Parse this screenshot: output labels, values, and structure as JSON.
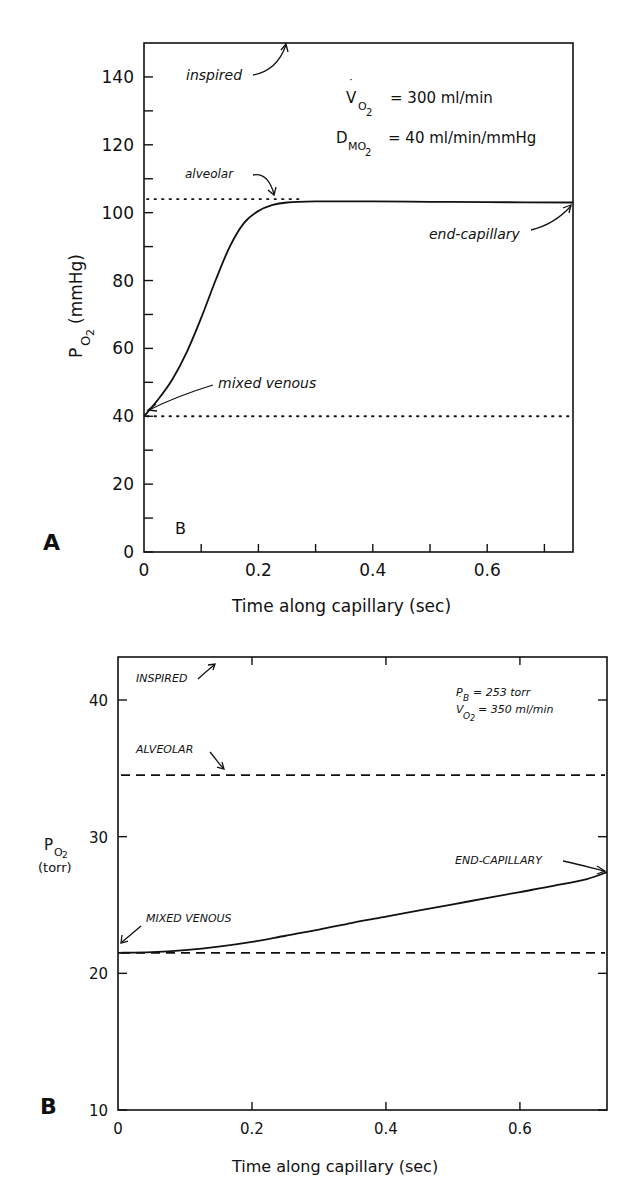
{
  "chart_data": [
    {
      "panel": "A",
      "type": "line",
      "title": "",
      "xlabel": "Time along capillary (sec)",
      "ylabel": "PO2 (mmHg)",
      "ylabel_main": "P",
      "ylabel_sub": "O2",
      "ylabel_unit": "(mmHg)",
      "xlim": [
        0,
        0.75
      ],
      "ylim": [
        0,
        150
      ],
      "x_ticks": [
        0,
        0.2,
        0.4,
        0.6
      ],
      "x_minor_ticks": [
        0.1,
        0.3,
        0.5,
        0.7
      ],
      "y_ticks": [
        0,
        20,
        40,
        60,
        80,
        100,
        120,
        140
      ],
      "y_tick_labels": [
        "0",
        "20",
        "40",
        "60",
        "80",
        "100",
        "120",
        "140"
      ],
      "y_minor_ticks": [
        10,
        30,
        50,
        70,
        90,
        110,
        130
      ],
      "grid": false,
      "series": [
        {
          "name": "capillary PO2",
          "x": [
            0,
            0.025,
            0.05,
            0.075,
            0.1,
            0.125,
            0.15,
            0.175,
            0.2,
            0.225,
            0.25,
            0.3,
            0.35,
            0.4,
            0.5,
            0.6,
            0.75
          ],
          "y": [
            40,
            45,
            51,
            59,
            69,
            80,
            90,
            97,
            100.5,
            102.3,
            103,
            103.3,
            103.3,
            103.3,
            103.2,
            103.1,
            103
          ]
        }
      ],
      "reference_lines": [
        {
          "name": "alveolar",
          "y": 104,
          "style": "dotted",
          "x_range": [
            0,
            0.28
          ]
        },
        {
          "name": "mixed venous",
          "y": 40,
          "style": "dotted",
          "x_range": [
            0,
            0.75
          ]
        }
      ],
      "annotations": [
        {
          "text": "inspired",
          "points_to": {
            "x": 0.18,
            "y": 150
          }
        },
        {
          "text": "alveolar",
          "points_to": {
            "x": 0.22,
            "y": 104
          }
        },
        {
          "text": "end-capillary",
          "points_to": {
            "x": 0.75,
            "y": 103
          }
        },
        {
          "text": "mixed venous",
          "points_to": {
            "x": 0,
            "y": 40
          }
        },
        {
          "text": "B",
          "at": {
            "x": 0.06,
            "y": 6
          }
        }
      ],
      "equations": [
        {
          "main": "V",
          "sub": "O2",
          "rest": "= 300 ml/min",
          "dot_over": true
        },
        {
          "main": "D",
          "sub": "MO2",
          "rest": "= 40 ml/min/mmHg",
          "dot_over": false
        }
      ]
    },
    {
      "panel": "B",
      "type": "line",
      "title": "",
      "xlabel": "Time along capillary (sec)",
      "ylabel": "PO2 (torr)",
      "ylabel_main": "P",
      "ylabel_sub": "O2",
      "ylabel_unit": "(torr)",
      "xlim": [
        0,
        0.73
      ],
      "ylim": [
        10,
        43
      ],
      "x_ticks": [
        0,
        0.2,
        0.4,
        0.6
      ],
      "y_ticks": [
        10,
        20,
        30,
        40
      ],
      "y_tick_labels": [
        "10",
        "20",
        "30",
        "40"
      ],
      "grid": false,
      "series": [
        {
          "name": "capillary PO2",
          "x": [
            0,
            0.05,
            0.1,
            0.15,
            0.2,
            0.25,
            0.3,
            0.35,
            0.4,
            0.45,
            0.5,
            0.55,
            0.6,
            0.65,
            0.7,
            0.73
          ],
          "y": [
            21.5,
            21.55,
            21.7,
            21.95,
            22.3,
            22.75,
            23.2,
            23.7,
            24.15,
            24.6,
            25.05,
            25.5,
            25.95,
            26.4,
            26.9,
            27.4
          ]
        }
      ],
      "reference_lines": [
        {
          "name": "alveolar",
          "y": 34.5,
          "style": "dashed",
          "x_range": [
            0,
            0.73
          ]
        },
        {
          "name": "mixed venous",
          "y": 21.5,
          "style": "dashed",
          "x_range": [
            0,
            0.73
          ]
        }
      ],
      "annotations": [
        {
          "text": "INSPIRED",
          "points_to": {
            "x": 0.15,
            "y": 43
          }
        },
        {
          "text": "ALVEOLAR",
          "points_to": {
            "x": 0.16,
            "y": 34.6
          }
        },
        {
          "text": "END-CAPILLARY",
          "points_to": {
            "x": 0.73,
            "y": 27.4
          }
        },
        {
          "text": "MIXED VENOUS",
          "points_to": {
            "x": 0,
            "y": 21.5
          }
        }
      ],
      "equations": [
        {
          "main": "P",
          "sub": "B",
          "rest": "= 253 torr",
          "dot_over": false
        },
        {
          "main": "V",
          "sub": "O2",
          "rest": "= 350 ml/min",
          "dot_over": true
        }
      ]
    }
  ],
  "figure": {
    "panelA": {
      "label": "A",
      "xlabel": "Time along capillary (sec)",
      "ylabel_main": "P",
      "ylabel_sub": "O",
      "ylabel_sub2": "2",
      "ylabel_unit": "(mmHg)",
      "ann_inspired": "inspired",
      "ann_alveolar": "alveolar",
      "ann_endcap": "end-capillary",
      "ann_mixed": "mixed venous",
      "inset_letter": "B",
      "eq1_main": "V",
      "eq1_sub": "O",
      "eq1_sub2": "2",
      "eq1_rest": "= 300 ml/min",
      "eq2_main": "D",
      "eq2_sub": "MO",
      "eq2_sub2": "2",
      "eq2_rest": "= 40 ml/min/mmHg"
    },
    "panelB": {
      "label": "B",
      "xlabel": "Time along capillary (sec)",
      "ylabel_main": "P",
      "ylabel_sub": "O",
      "ylabel_sub2": "2",
      "ylabel_unit": "(torr)",
      "ann_inspired": "INSPIRED",
      "ann_alveolar": "ALVEOLAR",
      "ann_endcap": "END-CAPILLARY",
      "ann_mixed": "MIXED VENOUS",
      "eq1_main": "P",
      "eq1_sub": "B",
      "eq1_rest": "= 253 torr",
      "eq2_main": "V",
      "eq2_sub": "O",
      "eq2_sub2": "2",
      "eq2_rest": "= 350 ml/min"
    }
  }
}
